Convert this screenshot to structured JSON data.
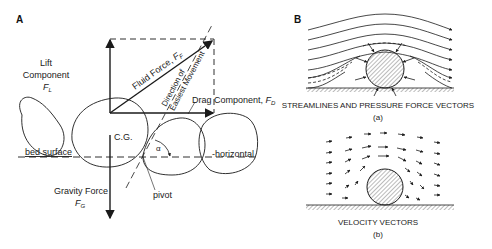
{
  "panel_a": {
    "label": "A",
    "lift": {
      "line1": "Lift",
      "line2": "Component",
      "symbol": "F",
      "sub": "L"
    },
    "fluid_force": {
      "text": "Fluid Force, ",
      "symbol": "F",
      "sub": "F"
    },
    "direction": {
      "line1": "Direction of",
      "line2": "Easiest Movement"
    },
    "drag": {
      "text": "Drag Component, ",
      "symbol": "F",
      "sub": "D"
    },
    "cg": "C.G.",
    "bed_surface": "bed surface",
    "horizontal": "horizontal",
    "alpha": "α",
    "gravity": {
      "line1": "Gravity Force",
      "symbol": "F",
      "sub": "G"
    },
    "pivot": "pivot"
  },
  "panel_b": {
    "label": "B",
    "caption_a": "STREAMLINES AND PRESSURE FORCE VECTORS",
    "sub_a": "(a)",
    "caption_b": "VELOCITY VECTORS",
    "sub_b": "(b)"
  },
  "colors": {
    "ink": "#1a1a1a",
    "background": "#ffffff"
  }
}
